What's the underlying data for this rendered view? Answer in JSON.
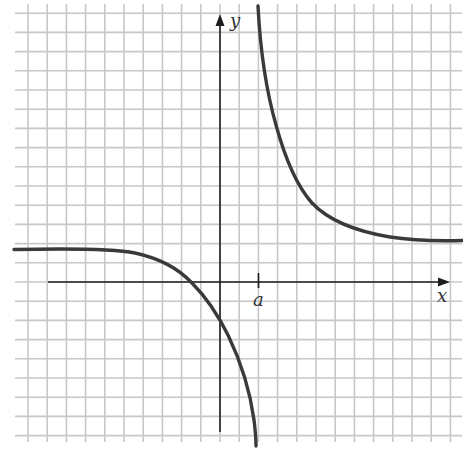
{
  "chart_data": {
    "type": "line",
    "title": "",
    "xlabel": "x",
    "ylabel": "y",
    "x_tick_labels": [
      "a"
    ],
    "grid": true,
    "grid_units": {
      "x_range": [
        -10.5,
        12.5
      ],
      "y_range": [
        -8,
        14.5
      ]
    },
    "asymptotes": {
      "vertical_x": "a",
      "vertical_x_units": 2,
      "horizontal_y_units": 2
    },
    "intercepts": {
      "x_intercept_units": -1.5,
      "y_intercept_units": -1.7
    },
    "series": [
      {
        "name": "left-branch",
        "x": [
          -10.5,
          -6,
          -4.7,
          -3.1,
          -1.5,
          -0.5,
          0.3,
          1.0,
          1.7,
          1.9
        ],
        "y": [
          1.7,
          1.7,
          1.6,
          1.0,
          0.0,
          -0.9,
          -2.3,
          -4.1,
          -6.2,
          -8.5
        ]
      },
      {
        "name": "right-branch",
        "x": [
          2.0,
          2.4,
          2.9,
          3.6,
          4.7,
          6.2,
          8.3,
          10.4,
          12.6
        ],
        "y": [
          14.4,
          11.6,
          9.0,
          6.1,
          4.0,
          3.0,
          2.3,
          2.1,
          2.1
        ]
      }
    ]
  },
  "plot": {
    "width": 463,
    "height": 450,
    "origin_px": {
      "x": 220,
      "y": 282
    },
    "grid_step_px": 19.2,
    "colors": {
      "grid": "#c8c8c8",
      "axis": "#1e1e1e",
      "curve": "#3a3a3a"
    },
    "labels": {
      "x_axis": "x",
      "y_axis": "y",
      "tick_a": "a"
    }
  }
}
